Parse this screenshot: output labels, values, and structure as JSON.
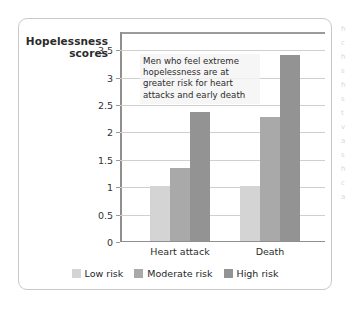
{
  "chart_data": {
    "type": "bar",
    "title": "",
    "subtitle": "",
    "xlabel": "",
    "ylabel": "Hopelessness scores",
    "categories": [
      "Heart attack",
      "Death"
    ],
    "series": [
      {
        "name": "Low risk",
        "values": [
          1,
          1
        ],
        "color": "#d4d4d4"
      },
      {
        "name": "Moderate risk",
        "values": [
          1.33,
          2.25
        ],
        "color": "#a9a9a9"
      },
      {
        "name": "High risk",
        "values": [
          2.35,
          3.38
        ],
        "color": "#939393"
      }
    ],
    "ylim": [
      0,
      3.83
    ],
    "yticks": [
      0,
      0.5,
      1,
      1.5,
      2,
      2.5,
      3,
      3.5
    ],
    "ytick_labels": [
      "0",
      "0.5",
      "1",
      "1.5",
      "2",
      "2.5",
      "3",
      "3.5"
    ],
    "grid": true,
    "legend_position": "bottom",
    "annotation": "Men who feel extreme hopelessness are at greater risk for heart attacks and early death"
  },
  "axis": {
    "y_title_line1": "Hopelessness",
    "y_title_line2": "scores"
  },
  "legend": {
    "items": [
      {
        "label": "Low risk"
      },
      {
        "label": "Moderate risk"
      },
      {
        "label": "High risk"
      }
    ]
  },
  "side_text": {
    "lines": [
      "h",
      "",
      "c",
      "h",
      "s",
      "h",
      "s",
      "t",
      "v",
      "a",
      "s",
      "h",
      "c",
      "a"
    ]
  }
}
